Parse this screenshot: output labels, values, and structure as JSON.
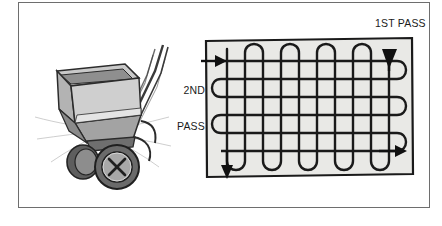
{
  "figure": {
    "caption_labels": {
      "first_pass": "1ST PASS",
      "second_pass_line1": "2ND",
      "second_pass_line2": "PASS"
    },
    "frame": {
      "border_color": "#6e6e6e",
      "background": "#ffffff"
    }
  },
  "spreader": {
    "name": "lawn-fertilizer-spreader",
    "parts": {
      "hopper": "hopper",
      "handle": "handle",
      "wheel_left": "left-wheel",
      "wheel_right": "right-wheel",
      "spread_lines": "broadcast-spray-lines"
    },
    "colors": {
      "outline": "#2b2b2b",
      "body_light": "#cfcfcf",
      "body_mid": "#9a9a9a",
      "body_dark": "#6b6b6b",
      "wheel_dark": "#555555"
    }
  },
  "pattern": {
    "name": "cross-hatch-spreading-pattern",
    "lawn_fill": "#e9e9e6",
    "stroke_color": "#1a1a1a",
    "horizontal_pass_count": 4,
    "vertical_pass_count": 5,
    "arrows": {
      "entry_left_horizontal": "arrow-right",
      "exit_bottom_left_vertical": "arrow-down",
      "entry_top_right_vertical": "arrow-down",
      "exit_bottom_right_horizontal": "arrow-right"
    }
  }
}
